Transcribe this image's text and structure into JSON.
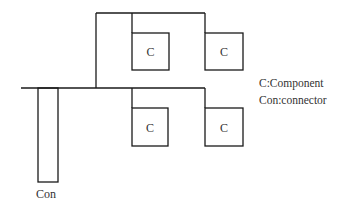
{
  "diagram": {
    "components": [
      {
        "id": "c1",
        "label": "C",
        "position": "top-left"
      },
      {
        "id": "c2",
        "label": "C",
        "position": "top-right"
      },
      {
        "id": "c3",
        "label": "C",
        "position": "bottom-left"
      },
      {
        "id": "c4",
        "label": "C",
        "position": "bottom-right"
      }
    ],
    "connector": {
      "label": "Con"
    },
    "legend": {
      "line1": "C:Component",
      "line2": "Con:connector"
    },
    "colors": {
      "stroke": "#1a1a1a",
      "text": "#333333",
      "background": "#ffffff"
    }
  }
}
